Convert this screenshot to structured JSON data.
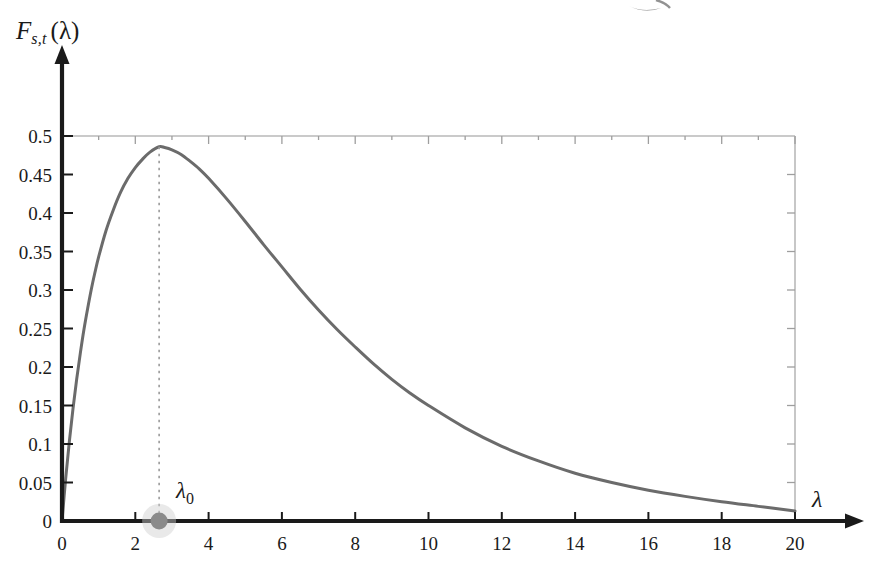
{
  "figure": {
    "ylabel": "F",
    "ylabel_sub": "s,t",
    "ylabel_arg": "(λ)",
    "xlabel": "λ",
    "lambda0_label": "λ",
    "lambda0_sub": "0",
    "background": "#ffffff",
    "curve_color": "#6b6b6b",
    "axis_color": "#1a1a1a",
    "frame_color": "#b9b9b9",
    "marker_color": "#8a8a8a"
  },
  "chart_data": {
    "type": "line",
    "title": "",
    "subtitle": "",
    "xlabel": "λ",
    "ylabel": "F_{s,t}(λ)",
    "xlim": [
      0,
      20
    ],
    "ylim": [
      0,
      0.5
    ],
    "grid": false,
    "legend": null,
    "xticks": [
      0,
      2,
      4,
      6,
      8,
      10,
      12,
      14,
      16,
      18,
      20
    ],
    "xtick_labels": [
      "0",
      "2",
      "4",
      "6",
      "8",
      "10",
      "12",
      "14",
      "16",
      "18",
      "20"
    ],
    "yticks": [
      0,
      0.05,
      0.1,
      0.15,
      0.2,
      0.25,
      0.3,
      0.35,
      0.4,
      0.45,
      0.5
    ],
    "ytick_labels": [
      "0",
      "0.05",
      "0.1",
      "0.15",
      "0.2",
      "0.25",
      "0.3",
      "0.35",
      "0.4",
      "0.45",
      "0.5"
    ],
    "xtick_minor_step": 1,
    "ytick_minor_step": 0.05,
    "annotations": [
      {
        "name": "lambda0-peak",
        "text": "λ₀",
        "x": 2.65,
        "y": 0.486,
        "type": "vertical-dotted-line-to-axis",
        "marker": "filled-circle-on-x-axis"
      }
    ],
    "series": [
      {
        "name": "F_{s,t}",
        "color": "#6b6b6b",
        "width": 3,
        "x": [
          0,
          0.1,
          0.2,
          0.3,
          0.4,
          0.5,
          0.6,
          0.7,
          0.8,
          0.9,
          1.0,
          1.2,
          1.4,
          1.6,
          1.8,
          2.0,
          2.2,
          2.4,
          2.65,
          2.8,
          3.0,
          3.25,
          3.5,
          3.75,
          4.0,
          4.5,
          5.0,
          5.5,
          6.0,
          6.5,
          7.0,
          7.5,
          8.0,
          8.5,
          9.0,
          9.5,
          10.0,
          11.0,
          12.0,
          13.0,
          14.0,
          15.0,
          16.0,
          17.0,
          18.0,
          19.0,
          20.0
        ],
        "y": [
          0.0,
          0.055,
          0.103,
          0.146,
          0.184,
          0.218,
          0.249,
          0.276,
          0.301,
          0.323,
          0.343,
          0.377,
          0.404,
          0.427,
          0.445,
          0.459,
          0.47,
          0.479,
          0.486,
          0.485,
          0.482,
          0.476,
          0.467,
          0.457,
          0.445,
          0.418,
          0.389,
          0.359,
          0.33,
          0.301,
          0.274,
          0.249,
          0.226,
          0.204,
          0.184,
          0.166,
          0.15,
          0.121,
          0.097,
          0.078,
          0.062,
          0.05,
          0.04,
          0.032,
          0.025,
          0.019,
          0.013
        ]
      }
    ]
  }
}
